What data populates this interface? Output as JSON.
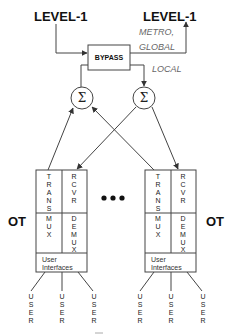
{
  "top": {
    "input_label": "LEVEL-1",
    "output_label": "LEVEL-1",
    "bypass_label": "BYPASS",
    "metro_label": "METRO,",
    "global_label": "GLOBAL",
    "local_label": "LOCAL"
  },
  "summers": {
    "left_symbol": "Σ",
    "right_symbol": "Σ"
  },
  "terminals": {
    "left": {
      "side_label": "OT",
      "trans": [
        "T",
        "R",
        "A",
        "N",
        "S"
      ],
      "mux": [
        "M",
        "U",
        "X"
      ],
      "rcvr": [
        "R",
        "C",
        "V",
        "R"
      ],
      "demux": [
        "D",
        "E",
        "M",
        "U",
        "X"
      ],
      "ui_line1": "User",
      "ui_line2": "Interfaces",
      "users": [
        "USER",
        "USER",
        "USER"
      ]
    },
    "right": {
      "side_label": "OT",
      "trans": [
        "T",
        "R",
        "A",
        "N",
        "S"
      ],
      "mux": [
        "M",
        "U",
        "X"
      ],
      "rcvr": [
        "R",
        "C",
        "V",
        "R"
      ],
      "demux": [
        "D",
        "E",
        "M",
        "U",
        "X"
      ],
      "ui_line1": "User",
      "ui_line2": "Interfaces",
      "users": [
        "USER",
        "USER",
        "USER"
      ]
    },
    "ellipsis": "•••"
  },
  "colors": {
    "line": "#444444",
    "text": "#111111",
    "italic_text": "#666666"
  }
}
